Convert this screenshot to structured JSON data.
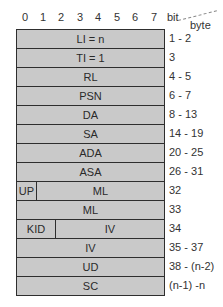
{
  "header": {
    "bits": [
      "0",
      "1",
      "2",
      "3",
      "4",
      "5",
      "6",
      "7"
    ],
    "bit_label": "bit",
    "byte_label": "byte"
  },
  "rows": [
    {
      "fields": [
        "LI = n"
      ],
      "bytes": "1 - 2"
    },
    {
      "fields": [
        "TI = 1"
      ],
      "bytes": "3"
    },
    {
      "fields": [
        "RL"
      ],
      "bytes": "4 - 5"
    },
    {
      "fields": [
        "PSN"
      ],
      "bytes": "6 - 7"
    },
    {
      "fields": [
        "DA"
      ],
      "bytes": "8 - 13"
    },
    {
      "fields": [
        "SA"
      ],
      "bytes": "14 - 19"
    },
    {
      "fields": [
        "ADA"
      ],
      "bytes": "20 - 25"
    },
    {
      "fields": [
        "ASA"
      ],
      "bytes": "26 - 31"
    },
    {
      "fields": [
        "UP",
        "ML"
      ],
      "bytes": "32"
    },
    {
      "fields": [
        "ML"
      ],
      "bytes": "33"
    },
    {
      "fields": [
        "KID",
        "IV"
      ],
      "bytes": "34"
    },
    {
      "fields": [
        "IV"
      ],
      "bytes": "35 - 37"
    },
    {
      "fields": [
        "UD"
      ],
      "bytes": "38 - (n-2)"
    },
    {
      "fields": [
        "SC"
      ],
      "bytes": "(n-1) -n"
    }
  ],
  "colors": {
    "cell_fill": "#c9c9c9",
    "border": "#2e2e2e"
  }
}
